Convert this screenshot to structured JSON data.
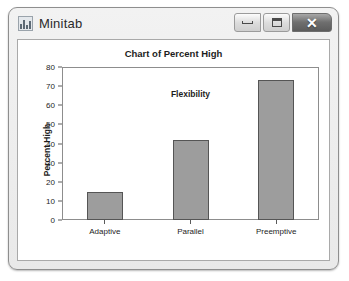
{
  "window": {
    "title": "Minitab",
    "icon": "bar-chart-icon",
    "controls": {
      "minimize": "–",
      "maximize": "□",
      "close": "✕"
    }
  },
  "chart_data": {
    "type": "bar",
    "title": "Chart of Percent High",
    "xlabel": "Flexibility",
    "ylabel": "Percent High",
    "categories": [
      "Adaptive",
      "Parallel",
      "Preemptive"
    ],
    "values": [
      14.5,
      42,
      73
    ],
    "ylim": [
      0,
      80
    ],
    "yticks": [
      0,
      10,
      20,
      30,
      40,
      50,
      60,
      70,
      80
    ],
    "ytick_labels": [
      "0",
      "10",
      "20",
      "30",
      "40",
      "50",
      "60",
      "70",
      "80"
    ],
    "grid": false,
    "legend": false,
    "bar_color": "#9d9d9d",
    "bar_border_color": "#555555"
  }
}
